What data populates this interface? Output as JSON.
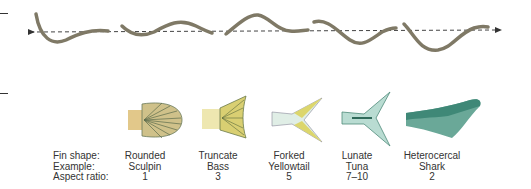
{
  "row_headers": {
    "fin_shape": "Fin shape:",
    "example": "Example:",
    "aspect_ratio": "Aspect ratio:"
  },
  "fins": [
    {
      "shape": "Rounded",
      "example": "Sculpin",
      "aspect_ratio": "1",
      "color": "#d8c07a"
    },
    {
      "shape": "Truncate",
      "example": "Bass",
      "aspect_ratio": "3",
      "color": "#d6c96a"
    },
    {
      "shape": "Forked",
      "example": "Yellowtail",
      "aspect_ratio": "5",
      "color": "#d9d36a"
    },
    {
      "shape": "Lunate",
      "example": "Tuna",
      "aspect_ratio": "7–10",
      "color": "#5e9e8e"
    },
    {
      "shape": "Heterocercal",
      "example": "Shark",
      "aspect_ratio": "2",
      "color": "#3f8a78"
    }
  ],
  "swimming_sequence": {
    "frames": 5,
    "eel_color": "#807a68",
    "axis_style": "dashed-arrow"
  }
}
